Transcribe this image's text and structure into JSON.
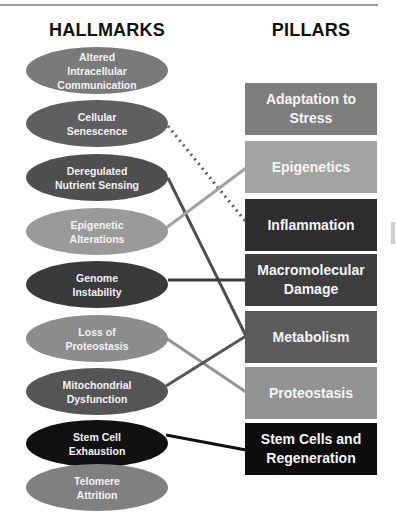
{
  "hallmarks": {
    "title": "HALLMARKS",
    "items": [
      {
        "label": "Altered\nIntracellular\nCommunication",
        "color": "#7a7a7a",
        "top": 47
      },
      {
        "label": "Cellular\nSenescence",
        "color": "#5f5f5f",
        "top": 100
      },
      {
        "label": "Deregulated\nNutrient Sensing",
        "color": "#4f4f4f",
        "top": 154
      },
      {
        "label": "Epigenetic\nAlterations",
        "color": "#9a9a9a",
        "top": 208
      },
      {
        "label": "Genome\nInstability",
        "color": "#3a3a3a",
        "top": 261
      },
      {
        "label": "Loss of\nProteostasis",
        "color": "#8c8c8c",
        "top": 315
      },
      {
        "label": "Mitochondrial\nDysfunction",
        "color": "#555555",
        "top": 368
      },
      {
        "label": "Stem Cell\nExhaustion",
        "color": "#111111",
        "top": 420
      },
      {
        "label": "Telomere\nAttrition",
        "color": "#808080",
        "top": 464
      }
    ]
  },
  "pillars": {
    "title": "PILLARS",
    "items": [
      {
        "label": "Adaptation to\nStress",
        "color": "#7e7e7e",
        "top": 83
      },
      {
        "label": "Epigenetics",
        "color": "#a3a3a3",
        "top": 141
      },
      {
        "label": "Inflammation",
        "color": "#2e2e2e",
        "top": 199
      },
      {
        "label": "Macromolecular\nDamage",
        "color": "#3d3d3d",
        "top": 254
      },
      {
        "label": "Metabolism",
        "color": "#5c5c5c",
        "top": 311
      },
      {
        "label": "Proteostasis",
        "color": "#939393",
        "top": 367
      },
      {
        "label": "Stem Cells and\nRegeneration",
        "color": "#0d0d0d",
        "top": 423
      }
    ]
  },
  "connections": [
    {
      "from": "Cellular Senescence",
      "to": "Inflammation",
      "style": "dotted",
      "color": "#5f5f5f"
    },
    {
      "from": "Deregulated Nutrient Sensing",
      "to": "Metabolism",
      "style": "solid",
      "color": "#4f4f4f"
    },
    {
      "from": "Epigenetic Alterations",
      "to": "Epigenetics",
      "style": "solid",
      "color": "#a3a3a3"
    },
    {
      "from": "Genome Instability",
      "to": "Macromolecular Damage",
      "style": "solid",
      "color": "#3a3a3a"
    },
    {
      "from": "Loss of Proteostasis",
      "to": "Proteostasis",
      "style": "solid",
      "color": "#939393"
    },
    {
      "from": "Mitochondrial Dysfunction",
      "to": "Metabolism",
      "style": "solid",
      "color": "#555555"
    },
    {
      "from": "Stem Cell Exhaustion",
      "to": "Stem Cells and Regeneration",
      "style": "solid",
      "color": "#111111"
    }
  ]
}
